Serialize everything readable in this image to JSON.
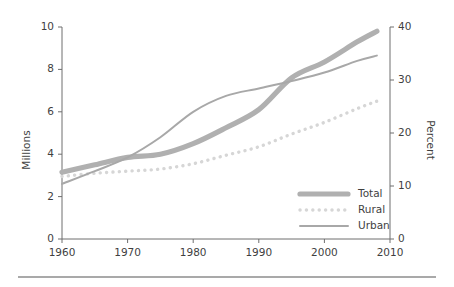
{
  "chart_data": {
    "type": "line",
    "title": "",
    "subtitle": "",
    "xlabel": "",
    "ylabel": "Millions",
    "y2label": "Percent",
    "xlim": [
      1960,
      2010
    ],
    "ylim": [
      0,
      10
    ],
    "y2lim": [
      0,
      40
    ],
    "grid": false,
    "legend_position": "lower right",
    "xticks": [
      "1960",
      "1970",
      "1980",
      "1990",
      "2000",
      "2010"
    ],
    "xtick_values": [
      1960,
      1970,
      1980,
      1990,
      2000,
      2010
    ],
    "yticks": [
      "0",
      "2",
      "4",
      "6",
      "8",
      "10"
    ],
    "ytick_values": [
      0,
      2,
      4,
      6,
      8,
      10
    ],
    "y2ticks": [
      "0",
      "10",
      "20",
      "30",
      "40"
    ],
    "y2tick_values": [
      0,
      10,
      20,
      30,
      40
    ],
    "x": [
      1960,
      1965,
      1970,
      1975,
      1980,
      1985,
      1990,
      1995,
      2000,
      2005,
      2008
    ],
    "series": [
      {
        "name": "Total",
        "axis": "left",
        "style": "thick-solid",
        "color": "#b0b0b0",
        "width": 5.2,
        "values": [
          3.15,
          3.5,
          3.85,
          4.0,
          4.5,
          5.25,
          6.1,
          7.6,
          8.35,
          9.3,
          9.8
        ]
      },
      {
        "name": "Rural",
        "axis": "left",
        "style": "dotted",
        "color": "#d6d6d6",
        "width": 3.4,
        "values": [
          2.95,
          3.1,
          3.2,
          3.3,
          3.55,
          3.95,
          4.35,
          4.95,
          5.5,
          6.15,
          6.5
        ]
      },
      {
        "name": "Urban",
        "axis": "left",
        "style": "thin-solid",
        "color": "#a8a8a8",
        "width": 2.0,
        "values": [
          2.6,
          3.2,
          3.85,
          4.8,
          6.0,
          6.75,
          7.1,
          7.45,
          7.85,
          8.4,
          8.65
        ]
      }
    ],
    "legend_entries": [
      {
        "label": "Total",
        "style": "thick-solid",
        "color": "#b0b0b0"
      },
      {
        "label": "Rural",
        "style": "dotted",
        "color": "#d6d6d6"
      },
      {
        "label": "Urban",
        "style": "thin-solid",
        "color": "#a8a8a8"
      }
    ],
    "colors": {
      "total": "#b0b0b0",
      "rural": "#d6d6d6",
      "urban": "#a8a8a8",
      "axis": "#6e6e6e",
      "text": "#3f3f3f",
      "background": "#ffffff",
      "rule": "#555555"
    }
  }
}
